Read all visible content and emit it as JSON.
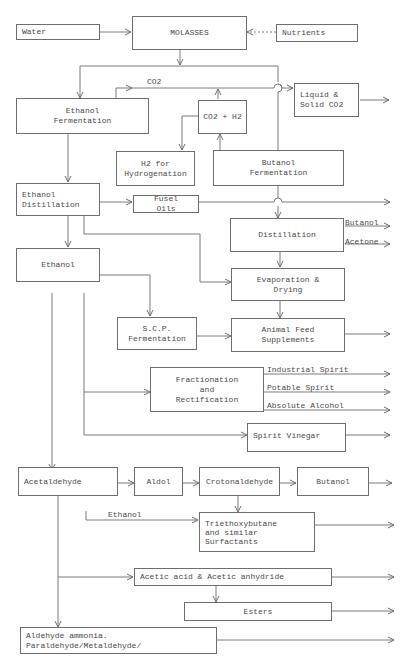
{
  "diagram": {
    "nodes": {
      "water": "Water",
      "molasses": "MOLASSES",
      "nutrients": "Nutrients",
      "ethanol_fermentation": "Ethanol\nFermentation",
      "co2_h2": "CO2 + H2",
      "liquid_solid_co2": "Liquid &\nSolid CO2",
      "h2_hydrogenation": "H2  for\nHydrogenation",
      "butanol_fermentation": "Butanol\nFermentation",
      "ethanol_distillation": "Ethanol\nDistillation",
      "fusel_oils": "Fusel\nOils",
      "distillation": "Distillation",
      "ethanol": "Ethanol",
      "evaporation_drying": "Evaporation &\nDrying",
      "scp_fermentation": "S.C.P.\nFermentation",
      "animal_feed": "Animal Feed\nSupplements",
      "fractionation": "Fractionation\nand\nRectification",
      "spirit_vinegar": "Spirit Vinegar",
      "acetaldehyde": "Acetaldehyde",
      "aldol": "Aldol",
      "crotonaldehyde": "Crotonaldehyde",
      "butanol_product": "Butanol",
      "triethoxybutane": "Triethoxybutane\nand similar\nSurfactants",
      "acetic_acid": "Acetic acid & Acetic anhydride",
      "esters": "Esters",
      "aldehyde_ammonia": "Aldehyde ammonia.\nParaldehyde/Metaldehyde/"
    },
    "labels": {
      "co2": "CO2",
      "butanol_out": "Butanol",
      "acetone_out": "Acetone",
      "industrial_spirit": "Industrial Spirit",
      "potable_spirit": "Potable Spirit",
      "absolute_alcohol": "Absolute Alcohol",
      "ethanol_input": "Ethanol"
    }
  }
}
